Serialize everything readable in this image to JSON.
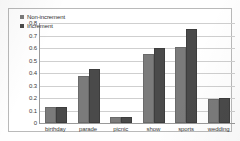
{
  "chart_data": {
    "type": "bar",
    "title": "",
    "subtitle": "",
    "xlabel": "",
    "ylabel": "",
    "categories": [
      "birthday",
      "parade",
      "picnic",
      "show",
      "sports",
      "wedding"
    ],
    "series": [
      {
        "name": "Non-increment",
        "color": "#7b7b7b",
        "values": [
          0.13,
          0.38,
          0.05,
          0.55,
          0.61,
          0.19
        ]
      },
      {
        "name": "Increment",
        "color": "#4a4a4a",
        "values": [
          0.13,
          0.43,
          0.05,
          0.6,
          0.75,
          0.2
        ]
      }
    ],
    "ylim": [
      0,
      0.8
    ],
    "yticks": [
      "0",
      "0.1",
      "0.2",
      "0.3",
      "0.4",
      "0.5",
      "0.6",
      "0.7",
      "0.8"
    ],
    "ytick_values": [
      0,
      0.1,
      0.2,
      0.3,
      0.4,
      0.5,
      0.6,
      0.7,
      0.8
    ],
    "grid": true,
    "grid_axis": "y",
    "legend_position": "top-left-inside",
    "bar_mode": "grouped"
  }
}
